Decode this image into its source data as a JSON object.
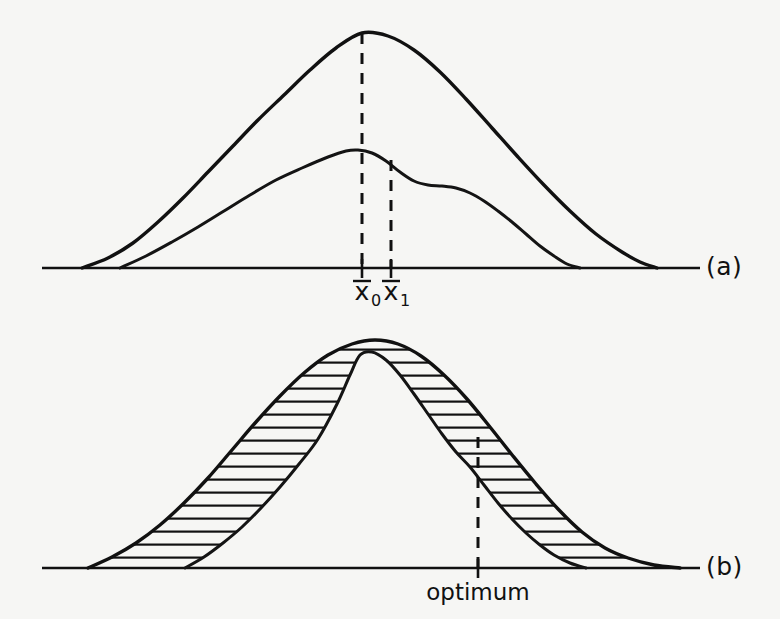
{
  "figure": {
    "background_color": "#f6f6f4",
    "ink_color": "#111111",
    "panels": [
      {
        "id": "a",
        "label": "(a)",
        "label_x": 706,
        "label_y": 275,
        "baseline": {
          "y": 268,
          "x_start": 42,
          "x_end": 700
        },
        "description": "Two overlapping unimodal distribution curves sharing one baseline; dashed verticals drop from the peaks of each curve to the axis.",
        "annotations": [
          {
            "name": "mean-0",
            "text": "x",
            "subscript": "0",
            "overbar": true,
            "x": 362,
            "label_y": 300
          },
          {
            "name": "mean-1",
            "text": "x",
            "subscript": "1",
            "overbar": true,
            "x": 391,
            "label_y": 300
          }
        ],
        "ticks": [
          {
            "x": 362,
            "y_top": 259,
            "y_bottom": 278
          },
          {
            "x": 391,
            "y_top": 259,
            "y_bottom": 278
          }
        ],
        "dashed_lines": [
          {
            "name": "mean-0-dashed-line",
            "x": 362,
            "y_top": 33,
            "y_bottom": 268
          },
          {
            "name": "mean-1-dashed-line",
            "x": 391,
            "y_top": 160,
            "y_bottom": 268
          }
        ]
      },
      {
        "id": "b",
        "label": "(b)",
        "label_x": 706,
        "label_y": 575,
        "baseline": {
          "y": 568,
          "x_start": 42,
          "x_end": 700
        },
        "description": "Two overlapping distribution curves with the region between them hatched with horizontal lines; a dashed vertical marks the optimum at the curve crossing point.",
        "annotations": [
          {
            "name": "optimum-label",
            "text": "optimum",
            "x": 478,
            "label_y": 600
          }
        ],
        "ticks": [
          {
            "x": 478,
            "y_top": 559,
            "y_bottom": 578
          }
        ],
        "dashed_lines": [
          {
            "name": "optimum-dashed-line",
            "x": 478,
            "y_top": 437,
            "y_bottom": 568
          }
        ],
        "hatching": {
          "style": "horizontal-lines",
          "spacing": 13,
          "stroke_width": 2.2
        }
      }
    ]
  },
  "chart_data": {
    "type": "line",
    "title": "",
    "xlabel": "",
    "ylabel": "",
    "grid": false,
    "legend": "none",
    "panels": [
      {
        "id": "a",
        "label": "(a)",
        "baseline_y": 268,
        "series": [
          {
            "name": "outer-curve-a",
            "role": "broad distribution",
            "peak_x": 362,
            "peak_y": 33,
            "x_start": 82,
            "x_end": 657,
            "points": [
              [
                82,
                268
              ],
              [
                108,
                258
              ],
              [
                133,
                243
              ],
              [
                158,
                222
              ],
              [
                183,
                198
              ],
              [
                208,
                172
              ],
              [
                233,
                146
              ],
              [
                258,
                120
              ],
              [
                284,
                95
              ],
              [
                310,
                70
              ],
              [
                336,
                48
              ],
              [
                362,
                33
              ],
              [
                388,
                36
              ],
              [
                414,
                50
              ],
              [
                440,
                72
              ],
              [
                466,
                99
              ],
              [
                492,
                128
              ],
              [
                518,
                157
              ],
              [
                544,
                185
              ],
              [
                570,
                211
              ],
              [
                596,
                234
              ],
              [
                622,
                252
              ],
              [
                640,
                262
              ],
              [
                657,
                268
              ]
            ]
          },
          {
            "name": "inner-curve-a",
            "role": "narrower distribution with right shoulder",
            "peak_x": 358,
            "peak_y": 150,
            "shoulder_x_range": [
              418,
              448
            ],
            "shoulder_y": 186,
            "x_start": 120,
            "x_end": 580,
            "points": [
              [
                120,
                268
              ],
              [
                146,
                256
              ],
              [
                172,
                242
              ],
              [
                198,
                227
              ],
              [
                224,
                211
              ],
              [
                250,
                195
              ],
              [
                276,
                180
              ],
              [
                302,
                168
              ],
              [
                328,
                157
              ],
              [
                346,
                151
              ],
              [
                358,
                150
              ],
              [
                372,
                153
              ],
              [
                386,
                161
              ],
              [
                400,
                172
              ],
              [
                414,
                181
              ],
              [
                428,
                185
              ],
              [
                442,
                186
              ],
              [
                456,
                188
              ],
              [
                470,
                193
              ],
              [
                484,
                201
              ],
              [
                498,
                211
              ],
              [
                512,
                222
              ],
              [
                526,
                234
              ],
              [
                540,
                246
              ],
              [
                554,
                256
              ],
              [
                567,
                264
              ],
              [
                580,
                268
              ]
            ]
          }
        ]
      },
      {
        "id": "b",
        "label": "(b)",
        "baseline_y": 568,
        "crossing_x": 478,
        "series": [
          {
            "name": "outer-curve-b",
            "role": "broad distribution (hatched band outer boundary)",
            "peak_x": 375,
            "peak_y": 340,
            "x_start": 88,
            "x_end": 680,
            "points": [
              [
                88,
                568
              ],
              [
                112,
                557
              ],
              [
                136,
                543
              ],
              [
                160,
                525
              ],
              [
                184,
                503
              ],
              [
                208,
                478
              ],
              [
                232,
                450
              ],
              [
                256,
                422
              ],
              [
                280,
                396
              ],
              [
                304,
                373
              ],
              [
                328,
                355
              ],
              [
                352,
                344
              ],
              [
                375,
                340
              ],
              [
                398,
                344
              ],
              [
                421,
                356
              ],
              [
                444,
                375
              ],
              [
                467,
                399
              ],
              [
                490,
                427
              ],
              [
                513,
                456
              ],
              [
                536,
                484
              ],
              [
                559,
                510
              ],
              [
                582,
                532
              ],
              [
                605,
                548
              ],
              [
                628,
                558
              ],
              [
                654,
                565
              ],
              [
                680,
                568
              ]
            ]
          },
          {
            "name": "inner-curve-b",
            "role": "narrower distribution (hatched band inner boundary)",
            "peak_x": 360,
            "peak_y": 355,
            "x_start": 185,
            "x_end": 586,
            "points": [
              [
                185,
                568
              ],
              [
                204,
                557
              ],
              [
                223,
                543
              ],
              [
                242,
                527
              ],
              [
                261,
                508
              ],
              [
                280,
                487
              ],
              [
                299,
                464
              ],
              [
                318,
                439
              ],
              [
                337,
                404
              ],
              [
                350,
                375
              ],
              [
                360,
                355
              ],
              [
                372,
                352
              ],
              [
                386,
                360
              ],
              [
                400,
                375
              ],
              [
                414,
                394
              ],
              [
                428,
                414
              ],
              [
                442,
                434
              ],
              [
                456,
                452
              ],
              [
                470,
                467
              ],
              [
                484,
                485
              ],
              [
                498,
                503
              ],
              [
                512,
                519
              ],
              [
                526,
                533
              ],
              [
                540,
                545
              ],
              [
                554,
                555
              ],
              [
                570,
                563
              ],
              [
                586,
                568
              ]
            ]
          }
        ],
        "shaded_regions": [
          {
            "name": "hatched-area",
            "fill": "horizontal-hatch",
            "between": [
              "outer-curve-b",
              "inner-curve-b"
            ]
          }
        ]
      }
    ]
  }
}
